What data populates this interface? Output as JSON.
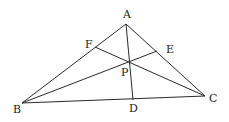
{
  "diagram": {
    "type": "triangle-cevians",
    "stroke_color": "#2a2a2a",
    "points": {
      "A": {
        "label": "A",
        "x": 126,
        "y": 24,
        "lx": 127,
        "ly": 18
      },
      "B": {
        "label": "B",
        "x": 22,
        "y": 103,
        "lx": 17,
        "ly": 113
      },
      "C": {
        "label": "C",
        "x": 205,
        "y": 96,
        "lx": 213,
        "ly": 102
      },
      "D": {
        "label": "D",
        "x": 133,
        "y": 100,
        "lx": 133,
        "ly": 112
      },
      "E": {
        "label": "E",
        "x": 157,
        "y": 51,
        "lx": 171,
        "ly": 53
      },
      "F": {
        "label": "F",
        "x": 95,
        "y": 47,
        "lx": 89,
        "ly": 48
      },
      "P": {
        "label": "P",
        "x": 129,
        "y": 62,
        "lx": 125,
        "ly": 76
      }
    },
    "segments": [
      [
        "A",
        "B"
      ],
      [
        "A",
        "C"
      ],
      [
        "B",
        "C"
      ],
      [
        "A",
        "D"
      ],
      [
        "B",
        "E"
      ],
      [
        "C",
        "F"
      ]
    ]
  }
}
